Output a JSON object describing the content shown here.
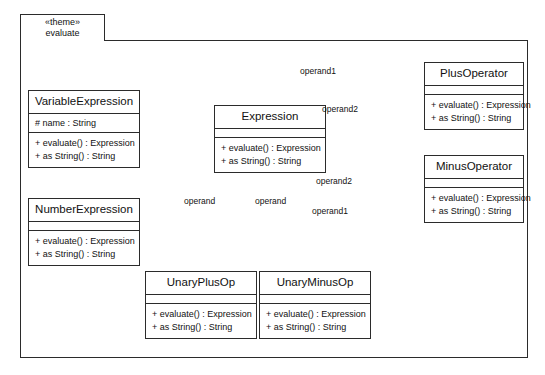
{
  "diagram": {
    "type": "uml-class-diagram",
    "package": {
      "stereotype": "«theme»",
      "name": "evaluate"
    },
    "classes": [
      {
        "id": "variable-expression",
        "name": "VariableExpression",
        "attributes": [
          "# name : String"
        ],
        "operations": [
          "+ evaluate() : Expression",
          "+ as String() : String"
        ]
      },
      {
        "id": "number-expression",
        "name": "NumberExpression",
        "attributes": [],
        "operations": [
          "+ evaluate() : Expression",
          "+ as String() : String"
        ]
      },
      {
        "id": "expression",
        "name": "Expression",
        "attributes": [],
        "operations": [
          "+ evaluate() : Expression",
          "+ as String() : String"
        ]
      },
      {
        "id": "plus-operator",
        "name": "PlusOperator",
        "attributes": [],
        "operations": [
          "+ evaluate() : Expression",
          "+ as String() : String"
        ]
      },
      {
        "id": "minus-operator",
        "name": "MinusOperator",
        "attributes": [],
        "operations": [
          "+ evaluate() : Expression",
          "+ as String() : String"
        ]
      },
      {
        "id": "unary-plus-op",
        "name": "UnaryPlusOp",
        "attributes": [],
        "operations": [
          "+ evaluate() : Expression",
          "+ as String() : String"
        ]
      },
      {
        "id": "unary-minus-op",
        "name": "UnaryMinusOp",
        "attributes": [],
        "operations": [
          "+ evaluate() : Expression",
          "+ as String() : String"
        ]
      }
    ],
    "associations": [
      {
        "id": "plus-operand1",
        "label": "operand1",
        "from": "plus-operator",
        "to": "expression",
        "kind": "aggregation"
      },
      {
        "id": "plus-operand2",
        "label": "operand2",
        "from": "plus-operator",
        "to": "expression",
        "kind": "aggregation"
      },
      {
        "id": "minus-operand2",
        "label": "operand2",
        "from": "minus-operator",
        "to": "expression",
        "kind": "aggregation"
      },
      {
        "id": "minus-operand1",
        "label": "operand1",
        "from": "minus-operator",
        "to": "expression",
        "kind": "aggregation"
      },
      {
        "id": "unaryplus-operand",
        "label": "operand",
        "from": "unary-plus-op",
        "to": "expression",
        "kind": "aggregation"
      },
      {
        "id": "unaryminus-operand",
        "label": "operand",
        "from": "unary-minus-op",
        "to": "expression",
        "kind": "aggregation"
      }
    ],
    "generalizations": [
      {
        "id": "gen-variable",
        "from": "variable-expression",
        "to": "expression"
      },
      {
        "id": "gen-number",
        "from": "number-expression",
        "to": "expression"
      },
      {
        "id": "gen-plus",
        "from": "plus-operator",
        "to": "expression"
      },
      {
        "id": "gen-minus",
        "from": "minus-operator",
        "to": "expression"
      },
      {
        "id": "gen-unary-plus",
        "from": "unary-plus-op",
        "to": "expression"
      },
      {
        "id": "gen-unary-minus",
        "from": "unary-minus-op",
        "to": "expression"
      }
    ],
    "colors": {
      "stroke": "#2b2b2b",
      "fill": "#ffffff",
      "text": "#111111"
    }
  }
}
